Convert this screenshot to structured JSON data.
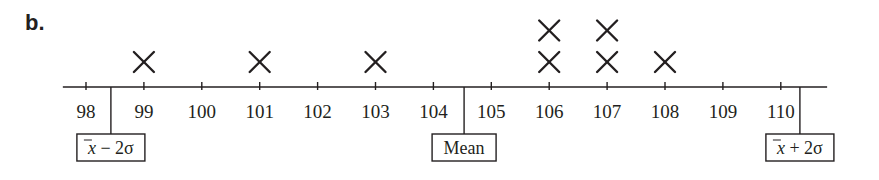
{
  "part_label": "b.",
  "chart_data": {
    "type": "dot",
    "title": "",
    "xlabel": "",
    "ylabel": "",
    "marker": "X",
    "x_ticks": [
      98,
      99,
      100,
      101,
      102,
      103,
      104,
      105,
      106,
      107,
      108,
      109,
      110
    ],
    "xlim": [
      97.6,
      110.8
    ],
    "grid": false,
    "points": [
      {
        "x": 99,
        "count": 1
      },
      {
        "x": 101,
        "count": 1
      },
      {
        "x": 103,
        "count": 1
      },
      {
        "x": 106,
        "count": 2
      },
      {
        "x": 107,
        "count": 2
      },
      {
        "x": 108,
        "count": 1
      }
    ],
    "values": [
      99,
      101,
      103,
      106,
      106,
      107,
      107,
      108
    ],
    "annotations": [
      {
        "label": "x̄ − 2σ",
        "x": 98.43,
        "id": "lower"
      },
      {
        "label": "Mean",
        "x": 104.53,
        "id": "mean"
      },
      {
        "label": "x̄ + 2σ",
        "x": 110.33,
        "id": "upper"
      }
    ]
  },
  "colors": {
    "ink": "#231f20",
    "background": "#ffffff"
  }
}
